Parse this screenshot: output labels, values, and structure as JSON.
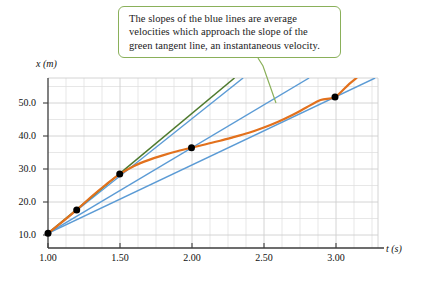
{
  "figure": {
    "callout": {
      "name": "annotation-callout",
      "lines": [
        "The slopes of the blue lines are average",
        "velocities which approach the slope of the",
        "green tangent line, an instantaneous velocity."
      ],
      "border_color": "#8ab05a",
      "leader_color": "#8ab05a"
    },
    "colors": {
      "curve": "#e2711d",
      "secant": "#5b9bd5",
      "tangent": "#4e7a2e",
      "point": "#000000",
      "grid": "#d9d9d9",
      "axis": "#3d3d3d"
    }
  },
  "chart_data": {
    "type": "line",
    "title": "",
    "xlabel": "t (s)",
    "ylabel": "x (m)",
    "xlim": [
      1.0,
      3.3
    ],
    "ylim": [
      0.0,
      58.0
    ],
    "grid": true,
    "legend": "none",
    "xticks": [
      "1.00",
      "1.50",
      "2.00",
      "2.50",
      "3.00"
    ],
    "xtick_values": [
      1.0,
      1.5,
      2.0,
      2.5,
      3.0
    ],
    "yticks": [
      "10.0",
      "20.0",
      "30.0",
      "40.0",
      "50.0"
    ],
    "ytick_values": [
      10.0,
      20.0,
      30.0,
      40.0,
      50.0
    ],
    "xminor_step": 0.125,
    "yminor_step": 5.0,
    "series": [
      {
        "name": "position curve",
        "type": "curve",
        "color": "#e2711d",
        "x": [
          1.0,
          1.1,
          1.2,
          1.3,
          1.4,
          1.5,
          1.6,
          1.7,
          1.8,
          1.9,
          2.0,
          2.1,
          2.2,
          2.3,
          2.4,
          2.5,
          2.6,
          2.7,
          2.8,
          2.9,
          3.0,
          3.1,
          3.15
        ],
        "y": [
          5.0,
          8.9,
          13.0,
          17.4,
          21.5,
          25.2,
          28.0,
          30.0,
          31.6,
          33.0,
          34.2,
          35.4,
          36.6,
          37.9,
          39.3,
          41.0,
          43.0,
          45.3,
          47.9,
          50.5,
          51.5,
          56.0,
          58.0
        ]
      },
      {
        "name": "tangent line at t=1.50",
        "type": "line",
        "color": "#4e7a2e",
        "x": [
          1.0,
          2.3
        ],
        "y": [
          5.0,
          58.0
        ],
        "slope": 40.8
      },
      {
        "name": "secant line to t=1.50",
        "type": "line",
        "color": "#5b9bd5",
        "x": [
          1.0,
          2.36
        ],
        "y": [
          5.0,
          58.0
        ],
        "slope": 39.0
      },
      {
        "name": "secant line to t=2.00",
        "type": "line",
        "color": "#5b9bd5",
        "x": [
          1.0,
          2.82
        ],
        "y": [
          5.0,
          58.0
        ],
        "slope": 29.2
      },
      {
        "name": "secant line to t=3.00",
        "type": "line",
        "color": "#5b9bd5",
        "x": [
          1.0,
          3.28
        ],
        "y": [
          5.0,
          58.0
        ],
        "slope": 23.2
      }
    ],
    "points": [
      {
        "name": "point-t1.00",
        "x": 1.0,
        "y": 5.0
      },
      {
        "name": "point-t1.20",
        "x": 1.2,
        "y": 13.0
      },
      {
        "name": "point-t1.50",
        "x": 1.5,
        "y": 25.2
      },
      {
        "name": "point-t2.00",
        "x": 2.0,
        "y": 34.2
      },
      {
        "name": "point-t3.00",
        "x": 3.0,
        "y": 51.5
      }
    ]
  }
}
